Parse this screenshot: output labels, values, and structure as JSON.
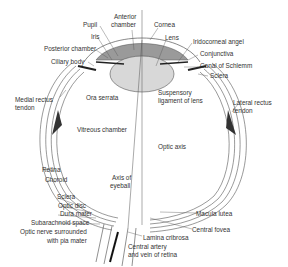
{
  "diagram": {
    "labels": {
      "pupil": "Pupil",
      "anterior_chamber_1": "Anterior",
      "anterior_chamber_2": "chamber",
      "cornea": "Cornea",
      "lens": "Lens",
      "iris": "Iris",
      "posterior_chamber": "Posterior chamber",
      "ciliary_body": "Ciliary body",
      "iridocorneal_angle": "Iridocorneal angel",
      "conjunctiva": "Conjunctiva",
      "canal_of_schlemm": "Canal of Schlemm",
      "sclera_top": "Sclera",
      "suspensory_1": "Suspensory",
      "suspensory_2": "ligament of lens",
      "medial_rectus_1": "Medial rectus",
      "medial_rectus_2": "tendon",
      "ora_serrata": "Ora serrata",
      "lateral_rectus_1": "Lateral rectus",
      "lateral_rectus_2": "tendon",
      "vitreous_chamber": "Vitreous chamber",
      "optic_axis": "Optic axis",
      "retina": "Retina",
      "choroid": "Choroid",
      "axis_eyeball_1": "Axis of",
      "axis_eyeball_2": "eyeball",
      "sclera_bottom": "Sclera",
      "optic_disc": "Optic disc",
      "dura_mater": "Dura mater",
      "subarachnoid": "Subarachnoid space",
      "optic_nerve_1": "Optic nerve surrounded",
      "optic_nerve_2": "with pia mater",
      "macula_lutea": "Macula lutea",
      "central_fovea": "Central fovea",
      "lamina_cribrosa": "Lamina cribrosa",
      "central_artery_1": "Central artery",
      "central_artery_2": "and vein of retina"
    },
    "colors": {
      "line": "#444444",
      "lens_fill": "#d0d0d0",
      "chamber_fill": "#9a9a9a",
      "text": "#333333"
    }
  }
}
